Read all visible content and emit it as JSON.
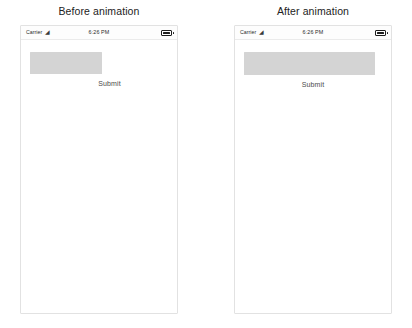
{
  "page": {
    "background_color": "#ffffff",
    "width": 412,
    "height": 328
  },
  "panels": [
    {
      "id": "before",
      "caption": "Before animation",
      "status_bar": {
        "carrier": "Carrier",
        "wifi_icon": "wifi-icon",
        "time": "6:26 PM",
        "battery_icon": "battery-icon",
        "battery_level_percent": 100
      },
      "screen": {
        "text_field": {
          "name": "text-field",
          "value": "",
          "placeholder": "",
          "fill_color": "#d4d4d4",
          "state": "collapsed"
        },
        "submit_label": "Submit"
      }
    },
    {
      "id": "after",
      "caption": "After animation",
      "status_bar": {
        "carrier": "Carrier",
        "wifi_icon": "wifi-icon",
        "time": "6:26 PM",
        "battery_icon": "battery-icon",
        "battery_level_percent": 100
      },
      "screen": {
        "text_field": {
          "name": "text-field",
          "value": "",
          "placeholder": "",
          "fill_color": "#d4d4d4",
          "state": "expanded"
        },
        "submit_label": "Submit"
      }
    }
  ]
}
